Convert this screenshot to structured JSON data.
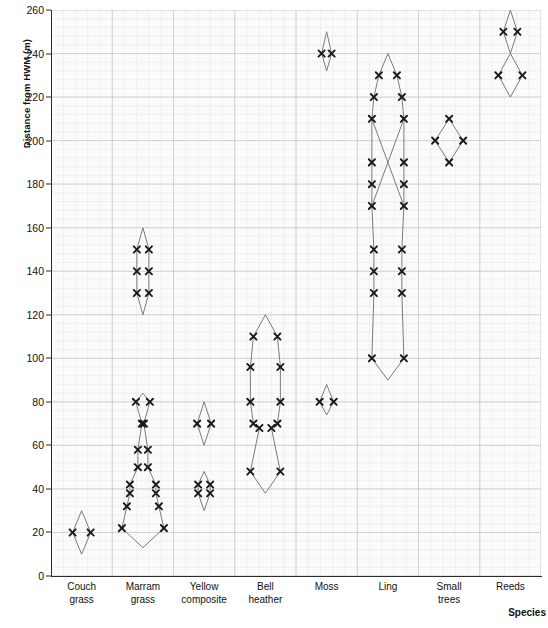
{
  "chart_data": {
    "type": "area",
    "title": "",
    "subtitle": "",
    "xlabel": "Species",
    "ylabel": "Distance from HWM (m)",
    "ylim": [
      0,
      260
    ],
    "y_ticks": [
      0,
      20,
      40,
      60,
      80,
      100,
      120,
      140,
      160,
      180,
      200,
      220,
      240,
      260
    ],
    "grid": true,
    "grid_minor": true,
    "legend": "none",
    "marker": "x",
    "categories": [
      "Couch grass",
      "Marram grass",
      "Yellow composite",
      "Bell heather",
      "Moss",
      "Ling",
      "Small trees",
      "Reeds"
    ],
    "category_lines": [
      [
        "Couch",
        "grass"
      ],
      [
        "Marram",
        "grass"
      ],
      [
        "Yellow",
        "composite"
      ],
      [
        "Bell",
        "heather"
      ],
      [
        "Moss",
        ""
      ],
      [
        "Ling",
        ""
      ],
      [
        "Small",
        "trees"
      ],
      [
        "Reeds",
        ""
      ]
    ],
    "series": [
      {
        "name": "Couch grass",
        "kites": [
          {
            "outline": [
              {
                "y": 30,
                "half": 0
              },
              {
                "y": 20,
                "half": 9
              },
              {
                "y": 10,
                "half": 0
              }
            ],
            "markers": [
              {
                "y": 20,
                "half": 9
              }
            ]
          }
        ]
      },
      {
        "name": "Marram grass",
        "kites": [
          {
            "outline": [
              {
                "y": 160,
                "half": 0
              },
              {
                "y": 150,
                "half": 6
              },
              {
                "y": 140,
                "half": 6
              },
              {
                "y": 130,
                "half": 6
              },
              {
                "y": 120,
                "half": 0
              }
            ],
            "markers": [
              {
                "y": 150,
                "half": 6
              },
              {
                "y": 140,
                "half": 6
              },
              {
                "y": 130,
                "half": 6
              }
            ]
          },
          {
            "outline": [
              {
                "y": 84,
                "half": 0
              },
              {
                "y": 80,
                "half": 7
              },
              {
                "y": 70,
                "half": 1
              },
              {
                "y": 58,
                "half": 5
              },
              {
                "y": 50,
                "half": 5
              },
              {
                "y": 42,
                "half": 13
              },
              {
                "y": 38,
                "half": 13
              },
              {
                "y": 32,
                "half": 16
              },
              {
                "y": 22,
                "half": 21
              },
              {
                "y": 13,
                "half": 0
              }
            ],
            "markers": [
              {
                "y": 80,
                "half": 7
              },
              {
                "y": 70,
                "half": 1
              },
              {
                "y": 58,
                "half": 5
              },
              {
                "y": 50,
                "half": 5
              },
              {
                "y": 42,
                "half": 13
              },
              {
                "y": 38,
                "half": 13
              },
              {
                "y": 32,
                "half": 16
              },
              {
                "y": 22,
                "half": 21
              }
            ]
          }
        ]
      },
      {
        "name": "Yellow composite",
        "kites": [
          {
            "outline": [
              {
                "y": 80,
                "half": 0
              },
              {
                "y": 70,
                "half": 7
              },
              {
                "y": 60,
                "half": 0
              }
            ],
            "markers": [
              {
                "y": 70,
                "half": 7
              }
            ]
          },
          {
            "outline": [
              {
                "y": 48,
                "half": 0
              },
              {
                "y": 42,
                "half": 6
              },
              {
                "y": 38,
                "half": 6
              },
              {
                "y": 30,
                "half": 0
              }
            ],
            "markers": [
              {
                "y": 42,
                "half": 6
              },
              {
                "y": 38,
                "half": 6
              }
            ]
          }
        ]
      },
      {
        "name": "Bell heather",
        "kites": [
          {
            "outline": [
              {
                "y": 120,
                "half": 0
              },
              {
                "y": 110,
                "half": 12
              },
              {
                "y": 96,
                "half": 15
              },
              {
                "y": 80,
                "half": 15
              },
              {
                "y": 70,
                "half": 12
              },
              {
                "y": 68,
                "half": 6
              },
              {
                "y": 48,
                "half": 15
              },
              {
                "y": 38,
                "half": 0
              }
            ],
            "markers": [
              {
                "y": 110,
                "half": 12
              },
              {
                "y": 96,
                "half": 15
              },
              {
                "y": 80,
                "half": 15
              },
              {
                "y": 70,
                "half": 12
              },
              {
                "y": 68,
                "half": 6
              },
              {
                "y": 48,
                "half": 15
              }
            ]
          }
        ]
      },
      {
        "name": "Moss",
        "kites": [
          {
            "outline": [
              {
                "y": 250,
                "half": 0
              },
              {
                "y": 240,
                "half": 5
              },
              {
                "y": 232,
                "half": 0
              }
            ],
            "markers": [
              {
                "y": 240,
                "half": 5
              }
            ]
          },
          {
            "outline": [
              {
                "y": 88,
                "half": 0
              },
              {
                "y": 80,
                "half": 7
              },
              {
                "y": 74,
                "half": 0
              }
            ],
            "markers": [
              {
                "y": 80,
                "half": 7
              }
            ]
          }
        ]
      },
      {
        "name": "Ling",
        "kites": [
          {
            "outline": [
              {
                "y": 240,
                "half": 0
              },
              {
                "y": 230,
                "half": 9
              },
              {
                "y": 220,
                "half": 14
              },
              {
                "y": 210,
                "half": 16
              },
              {
                "y": 190,
                "half": 16
              },
              {
                "y": 180,
                "half": 16
              },
              {
                "y": 170,
                "half": 16
              },
              {
                "y": 150,
                "half": 14
              },
              {
                "y": 140,
                "half": 14
              },
              {
                "y": 130,
                "half": 14
              },
              {
                "y": 100,
                "half": 16
              },
              {
                "y": 90,
                "half": 0
              }
            ],
            "markers": [
              {
                "y": 230,
                "half": 9
              },
              {
                "y": 220,
                "half": 14
              },
              {
                "y": 210,
                "half": 16
              },
              {
                "y": 190,
                "half": 16
              },
              {
                "y": 180,
                "half": 16
              },
              {
                "y": 170,
                "half": 16
              },
              {
                "y": 150,
                "half": 14
              },
              {
                "y": 140,
                "half": 14
              },
              {
                "y": 130,
                "half": 14
              },
              {
                "y": 100,
                "half": 16
              }
            ],
            "crossings": [
              {
                "from": 210,
                "to": 170
              }
            ]
          }
        ]
      },
      {
        "name": "Small trees",
        "kites": [
          {
            "outline": [
              {
                "y": 210,
                "half": 0
              },
              {
                "y": 200,
                "half": 14
              },
              {
                "y": 190,
                "half": 0
              }
            ],
            "markers": [
              {
                "y": 210,
                "half": 0
              },
              {
                "y": 200,
                "half": 14
              },
              {
                "y": 190,
                "half": 0
              }
            ]
          }
        ]
      },
      {
        "name": "Reeds",
        "kites": [
          {
            "outline": [
              {
                "y": 260,
                "half": 0
              },
              {
                "y": 250,
                "half": 7
              },
              {
                "y": 240,
                "half": 0
              }
            ],
            "markers": [
              {
                "y": 250,
                "half": 7
              }
            ]
          },
          {
            "outline": [
              {
                "y": 240,
                "half": 0
              },
              {
                "y": 230,
                "half": 12
              },
              {
                "y": 220,
                "half": 0
              }
            ],
            "markers": [
              {
                "y": 230,
                "half": 12
              }
            ]
          }
        ]
      }
    ]
  },
  "style": {
    "plot_background": "#fbfbfb",
    "grid_major_color": "#c9c9c9",
    "grid_minor_color": "#e4e4e4",
    "axis_color": "#2b2b2b",
    "kite_line_color": "#7a7a7a",
    "marker_color": "#1a1a1a"
  }
}
